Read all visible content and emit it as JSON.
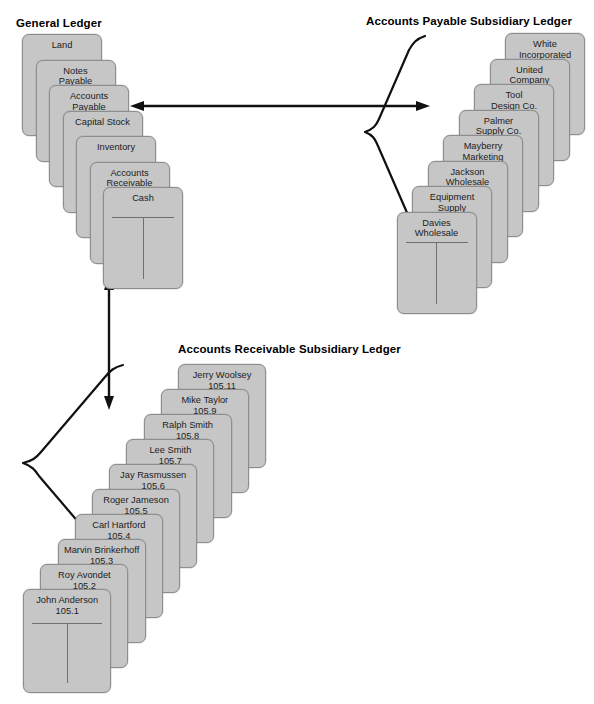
{
  "general_ledger": {
    "title": "General Ledger",
    "accounts": [
      {
        "name": "Land"
      },
      {
        "name": "Notes\nPayable"
      },
      {
        "name": "Accounts\nPayable"
      },
      {
        "name": "Capital Stock"
      },
      {
        "name": "Inventory"
      },
      {
        "name": "Accounts\nReceivable"
      },
      {
        "name": "Cash"
      }
    ]
  },
  "accounts_payable_ledger": {
    "title": "Accounts Payable Subsidiary Ledger",
    "accounts": [
      {
        "name": "White\nIncorporated"
      },
      {
        "name": "United\nCompany"
      },
      {
        "name": "Tool\nDesign Co."
      },
      {
        "name": "Palmer\nSupply Co."
      },
      {
        "name": "Mayberry\nMarketing"
      },
      {
        "name": "Jackson\nWholesale"
      },
      {
        "name": "Equipment\nSupply"
      },
      {
        "name": "Davies\nWholesale"
      }
    ]
  },
  "accounts_receivable_ledger": {
    "title": "Accounts Receivable Subsidiary Ledger",
    "accounts": [
      {
        "name": "Jerry Woolsey",
        "number": "105.11"
      },
      {
        "name": "Mike Taylor",
        "number": "105.9"
      },
      {
        "name": "Ralph Smith",
        "number": "105.8"
      },
      {
        "name": "Lee Smith",
        "number": "105.7"
      },
      {
        "name": "Jay Rasmussen",
        "number": "105.6"
      },
      {
        "name": "Roger Jameson",
        "number": "105.5"
      },
      {
        "name": "Carl Hartford",
        "number": "105.4"
      },
      {
        "name": "Marvin Brinkerhoff",
        "number": "105.3"
      },
      {
        "name": "Roy Avondet",
        "number": "105.2"
      },
      {
        "name": "John Anderson",
        "number": "105.1"
      }
    ]
  },
  "connectors": [
    {
      "id": "gl-to-ap",
      "kind": "double-arrow-horizontal"
    },
    {
      "id": "gl-to-ar",
      "kind": "double-arrow-vertical"
    }
  ],
  "colors": {
    "card_fill": "#c6c6c6",
    "card_border": "#8e8e8e",
    "rule": "#6f6f6f",
    "ink": "#111111",
    "background": "#ffffff"
  }
}
